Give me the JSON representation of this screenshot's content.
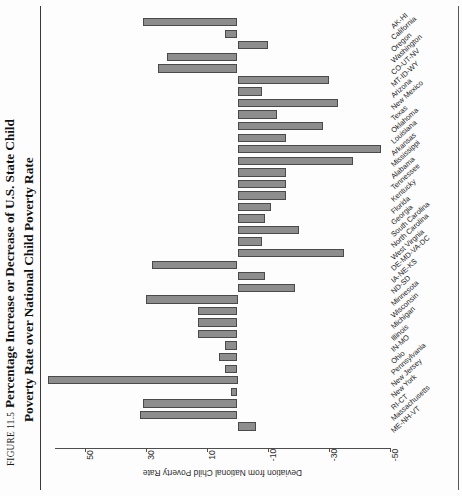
{
  "figure": {
    "number": "FIGURE 11.5",
    "title_line1": "Percentage Increase or Decrease of U.S. State Child",
    "title_line2": "Poverty Rate over National Child Poverty Rate"
  },
  "chart_data": {
    "type": "bar",
    "orientation": "horizontal",
    "title": "FIGURE 11.5  Percentage Increase or Decrease of U.S. State Child Poverty Rate over National Child Poverty Rate",
    "xlabel": "",
    "ylabel": "Deviation from National Child Poverty Rate",
    "value_axis_label": "Deviation from National Child Poverty Rate",
    "axis_reversed": true,
    "grid": false,
    "legend": null,
    "ylim": [
      -50,
      62
    ],
    "tick_values": [
      50,
      30,
      10,
      -10,
      -30,
      -50
    ],
    "tick_labels": [
      "50",
      "30",
      "10",
      "-10",
      "-30",
      "-50"
    ],
    "bar_color": "#8d8d8d",
    "bar_edge_color": "#4a4a4a",
    "categories": [
      "AK-HI",
      "California",
      "Oregon",
      "Washington",
      "CO-UT-NV",
      "MT-ID-WY",
      "Arizona",
      "New Mexico",
      "Texas",
      "Oklahoma",
      "Louisiana",
      "Arkansas",
      "Mississippi",
      "Alabama",
      "Tennessee",
      "Kentucky",
      "Florida",
      "Georgia",
      "South Carolina",
      "North Carolina",
      "West Virgnia",
      "DE-MD-VA-DC",
      "IA-NE-KS",
      "ND-SD",
      "Minnesota",
      "Wisconsin",
      "Michigan",
      "Illinois",
      "IN-MO",
      "Ohio",
      "Pennsylvania",
      "New Jersey",
      "New York",
      "RI-CT",
      "Massachusetts",
      "ME-NH-VT"
    ],
    "values": [
      31,
      4,
      -10,
      23,
      26,
      -30,
      -8,
      -33,
      -13,
      -28,
      -16,
      -47,
      -38,
      -16,
      -16,
      -16,
      -11,
      -9,
      -20,
      -8,
      -35,
      28,
      -9,
      -19,
      30,
      13,
      13,
      13,
      4,
      6,
      4,
      62,
      2,
      31,
      32,
      -6
    ]
  }
}
